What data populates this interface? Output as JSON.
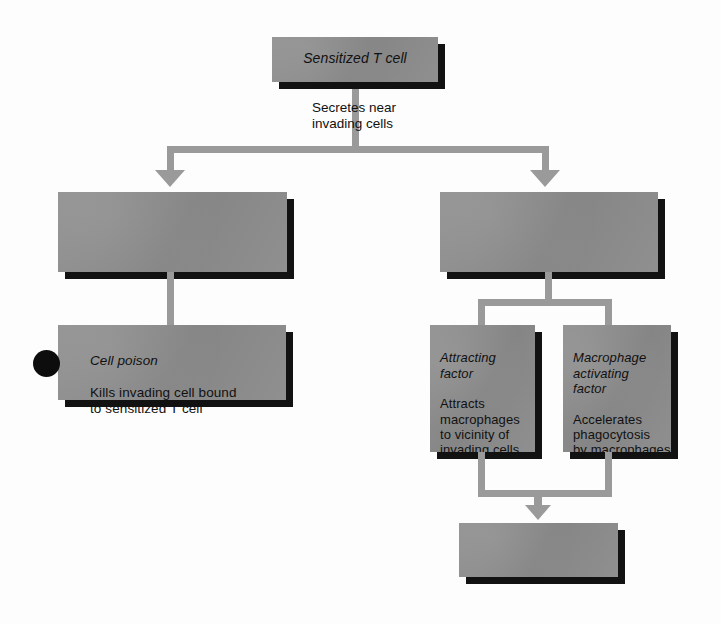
{
  "diagram": {
    "palette": {
      "box_fill": "#8f8f8f",
      "box_shadow": "#121212",
      "connector": "#9a9a9a",
      "marker": "#0d0d0d",
      "background": "#fdfdfd",
      "text": "#111111"
    },
    "nodes": {
      "top": {
        "label": "Sensitized T cell",
        "style": "italic"
      },
      "left_upper": {
        "label": ""
      },
      "right_upper": {
        "label": ""
      },
      "cell_poison": {
        "title": "Cell poison",
        "body": "Kills invading cell bound\nto sensitized T cell"
      },
      "attracting_factor": {
        "title": "Attracting\nfactor",
        "body": "Attracts\nmacrophages\nto vicinity of\ninvading cells"
      },
      "macrophage_activating_factor": {
        "title": "Macrophage\nactivating\nfactor",
        "body": "Accelerates\nphagocytosis\nby macrophages"
      },
      "bottom": {
        "label": ""
      }
    },
    "edges": {
      "secretes_caption": "Secretes near\ninvading cells"
    },
    "markers": {
      "cell_poison_bullet": "filled-circle"
    }
  }
}
